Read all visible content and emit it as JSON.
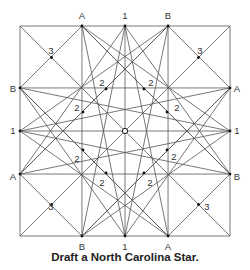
{
  "caption": "Draft a North Carolina Star.",
  "square": {
    "x0": 20,
    "y0": 26,
    "x1": 230,
    "y1": 236
  },
  "edge_labels": {
    "top": [
      "A",
      "1",
      "B"
    ],
    "right": [
      "A",
      "2",
      "B"
    ],
    "bottom": [
      "B",
      "1",
      "A"
    ],
    "left": [
      "B",
      "1",
      "A"
    ]
  },
  "colors": {
    "line": "#555555",
    "text": "#333333",
    "dot": "#111111"
  },
  "labels": [
    {
      "t": "A",
      "x": 82,
      "y": 19
    },
    {
      "t": "1",
      "x": 125,
      "y": 19
    },
    {
      "t": "B",
      "x": 168,
      "y": 19
    },
    {
      "t": "B",
      "x": 13,
      "y": 92
    },
    {
      "t": "1",
      "x": 13,
      "y": 134
    },
    {
      "t": "A",
      "x": 13,
      "y": 180
    },
    {
      "t": "A",
      "x": 237,
      "y": 92
    },
    {
      "t": "1",
      "x": 237,
      "y": 134
    },
    {
      "t": "B",
      "x": 237,
      "y": 180
    },
    {
      "t": "B",
      "x": 82,
      "y": 250
    },
    {
      "t": "1",
      "x": 125,
      "y": 250
    },
    {
      "t": "A",
      "x": 168,
      "y": 250
    },
    {
      "t": "3",
      "x": 51,
      "y": 54
    },
    {
      "t": "3",
      "x": 200,
      "y": 54
    },
    {
      "t": "3",
      "x": 51,
      "y": 210
    },
    {
      "t": "3",
      "x": 207,
      "y": 210
    },
    {
      "t": "2",
      "x": 102,
      "y": 86
    },
    {
      "t": "2",
      "x": 151,
      "y": 86
    },
    {
      "t": "2",
      "x": 77,
      "y": 111
    },
    {
      "t": "2",
      "x": 177,
      "y": 111
    },
    {
      "t": "2",
      "x": 77,
      "y": 162
    },
    {
      "t": "2",
      "x": 174,
      "y": 160
    },
    {
      "t": "2",
      "x": 102,
      "y": 186
    },
    {
      "t": "2",
      "x": 150,
      "y": 186
    }
  ]
}
